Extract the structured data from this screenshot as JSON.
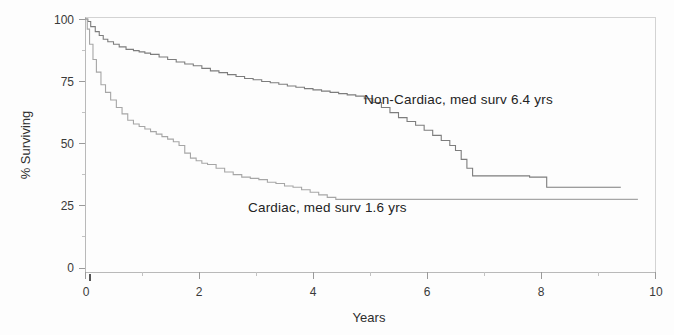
{
  "chart_data": {
    "type": "line",
    "title": "",
    "subtitle": "",
    "xlabel": "Years",
    "ylabel": "% Surviving",
    "xlim": [
      0,
      10
    ],
    "ylim": [
      0,
      100
    ],
    "grid": false,
    "legend_position": "inline-annotation",
    "x_ticks": [
      0,
      2,
      4,
      6,
      8,
      10
    ],
    "x_tick_labels": [
      "0",
      "2",
      "4",
      "6",
      "8",
      "10"
    ],
    "y_ticks": [
      0,
      25,
      50,
      75,
      100
    ],
    "y_tick_labels": [
      "0",
      "25",
      "50",
      "75",
      "100"
    ],
    "x_minor_ticks": [
      1,
      3,
      5,
      7,
      9
    ],
    "y_minor_ticks": [
      12.5,
      37.5,
      62.5,
      87.5
    ],
    "annotations": [
      {
        "name": "non-cardiac-label",
        "text": "Non-Cardiac, med   surv 6.4 yrs",
        "x": 4.9,
        "y": 68
      },
      {
        "name": "cardiac-label",
        "text": "Cardiac, med   surv 1.6 yrs",
        "x": 3.6,
        "y": 25
      }
    ],
    "series": [
      {
        "name": "Non-Cardiac",
        "label": "Non-Cardiac, med   surv 6.4 yrs",
        "color": "#7d7d7d",
        "median_survival_years": 6.4,
        "x": [
          0,
          0.05,
          0.1,
          0.18,
          0.25,
          0.32,
          0.4,
          0.5,
          0.6,
          0.72,
          0.85,
          0.95,
          1.05,
          1.15,
          1.3,
          1.45,
          1.6,
          1.75,
          1.9,
          2.05,
          2.2,
          2.35,
          2.5,
          2.65,
          2.8,
          2.95,
          3.1,
          3.25,
          3.4,
          3.55,
          3.7,
          3.85,
          4.0,
          4.15,
          4.3,
          4.45,
          4.6,
          4.75,
          4.9,
          5.05,
          5.2,
          5.35,
          5.5,
          5.65,
          5.8,
          5.95,
          6.1,
          6.25,
          6.4,
          6.5,
          6.6,
          6.7,
          6.8,
          7.0,
          7.3,
          7.6,
          7.8,
          8.1,
          8.5,
          9.0,
          9.4
        ],
        "y": [
          100,
          99,
          97,
          95,
          93.5,
          92,
          91,
          90,
          89,
          88,
          87.5,
          87,
          86.5,
          86,
          85,
          84,
          83,
          82.2,
          81.5,
          80.5,
          79.5,
          78.8,
          78,
          77.3,
          76.5,
          76,
          75.3,
          74.8,
          74.2,
          73.5,
          73,
          72.5,
          72,
          71.5,
          71,
          70.5,
          70,
          69.5,
          68.5,
          67,
          65,
          63,
          61,
          59.5,
          58,
          56,
          54,
          52,
          50,
          48,
          44.5,
          41,
          38,
          38,
          38,
          38,
          37.5,
          33.5,
          33.5,
          33.5,
          33.5
        ]
      },
      {
        "name": "Cardiac",
        "label": "Cardiac, med   surv 1.6 yrs",
        "color": "#a6a6a6",
        "median_survival_years": 1.6,
        "x": [
          0,
          0.04,
          0.08,
          0.14,
          0.2,
          0.28,
          0.36,
          0.45,
          0.55,
          0.65,
          0.75,
          0.85,
          0.95,
          1.05,
          1.15,
          1.25,
          1.35,
          1.45,
          1.55,
          1.65,
          1.75,
          1.85,
          1.95,
          2.05,
          2.15,
          2.3,
          2.45,
          2.6,
          2.75,
          2.9,
          3.05,
          3.2,
          3.35,
          3.5,
          3.65,
          3.8,
          3.95,
          4.1,
          4.25,
          4.4,
          4.8,
          5.4,
          6.0,
          6.8,
          7.6,
          8.4,
          9.2,
          9.7
        ],
        "y": [
          100,
          96,
          90,
          84,
          79,
          74,
          71,
          68,
          65,
          62.5,
          60,
          58.5,
          57.5,
          56.5,
          55.5,
          54.5,
          53.5,
          52.5,
          51.5,
          50,
          47,
          45,
          44,
          43,
          42.5,
          41,
          39.5,
          38.5,
          37.5,
          37,
          36.5,
          35.5,
          35,
          34,
          33.5,
          32.5,
          31.5,
          30.5,
          29.5,
          28.7,
          28.7,
          28.7,
          28.7,
          28.7,
          28.7,
          28.7,
          28.7,
          28.7
        ]
      }
    ]
  },
  "figure": {
    "background_color": "#fdfdfd",
    "axis_color": "#b9b9b9",
    "text_color": "#2e2e2e"
  }
}
